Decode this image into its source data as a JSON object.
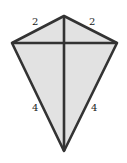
{
  "diagram": {
    "type": "kite",
    "fill_color": "#e2e2e2",
    "stroke_color": "#333333",
    "vertices": {
      "top": [
        64,
        16
      ],
      "left": [
        12,
        43
      ],
      "right": [
        117,
        43
      ],
      "bottom": [
        64,
        151
      ]
    },
    "labels": {
      "top_left": "2",
      "top_right": "2",
      "bottom_left": "4",
      "bottom_right": "4"
    }
  }
}
